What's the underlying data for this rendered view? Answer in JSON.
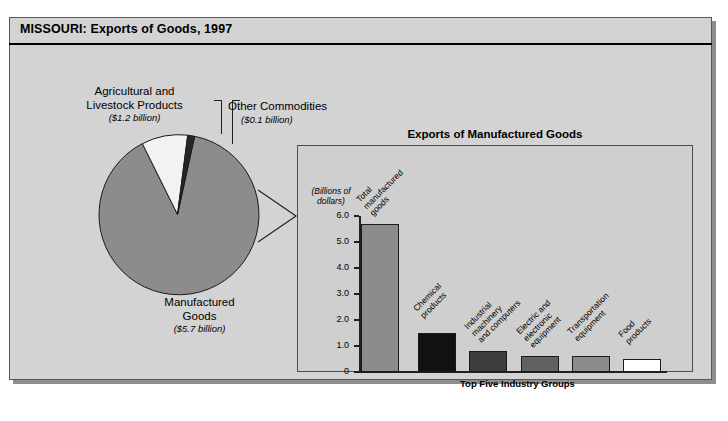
{
  "header": {
    "title": "MISSOURI: Exports of Goods, 1997"
  },
  "pie": {
    "labels": {
      "agricultural": {
        "name": "Agricultural and Livestock Products",
        "line1": "Agricultural and",
        "line2": "Livestock Products",
        "value": "($1.2 billion)"
      },
      "other": {
        "name": "Other Commodities",
        "line1": "Other Commodities",
        "value": "($0.1 billion)"
      },
      "manufactured": {
        "name": "Manufactured Goods",
        "line1": "Manufactured",
        "line2": "Goods",
        "value": "($5.7 billion)"
      }
    }
  },
  "panel": {
    "title": "Exports of Manufactured Goods",
    "units_line1": "(Billions of",
    "units_line2": "dollars)",
    "bracket_label": "Top Five Industry Groups"
  },
  "colors": {
    "page_background": "#ffffff",
    "card_background": "#d3d3d3",
    "panel_background": "#cfcfcf",
    "pie_manufactured": "#8c8c8c",
    "pie_agricultural": "#f2f2f2",
    "pie_other": "#262626",
    "bar_total": "#8c8c8c",
    "bar_chemical": "#111111",
    "bar_industrial": "#3d3d3d",
    "bar_electric": "#616161",
    "bar_transportation": "#8c8c8c",
    "bar_food": "#ffffff",
    "axis": "#231f20"
  },
  "chart_data": [
    {
      "type": "pie",
      "title": "MISSOURI: Exports of Goods, 1997",
      "categories": [
        "Manufactured Goods",
        "Agricultural and Livestock Products",
        "Other Commodities"
      ],
      "values": [
        5.7,
        1.2,
        0.1
      ],
      "units": "billions of dollars",
      "labels": [
        "($5.7 billion)",
        "($1.2 billion)",
        "($0.1 billion)"
      ],
      "legend": "none"
    },
    {
      "type": "bar",
      "title": "Exports of Manufactured Goods",
      "xlabel": "",
      "ylabel": "(Billions of dollars)",
      "ylim": [
        0,
        6.0
      ],
      "yticks": [
        "0",
        "1.0",
        "2.0",
        "3.0",
        "4.0",
        "5.0",
        "6.0"
      ],
      "grid": false,
      "legend": "none",
      "annotation": "Top Five Industry Groups",
      "categories": [
        "Total manufactured goods",
        "Chemical products",
        "Industrial machinery and computers",
        "Electric and electronic equipment",
        "Transportation equipment",
        "Food products"
      ],
      "category_lines": [
        [
          "Total",
          "manufactured",
          "goods"
        ],
        [
          "Chemical",
          "products"
        ],
        [
          "Industrial",
          "machinery",
          "and computers"
        ],
        [
          "Electric and",
          "electronic",
          "equipment"
        ],
        [
          "Transportation",
          "equipment"
        ],
        [
          "Food",
          "products"
        ]
      ],
      "values": [
        5.7,
        1.5,
        0.8,
        0.6,
        0.6,
        0.5
      ],
      "bar_colors": [
        "#8c8c8c",
        "#111111",
        "#3d3d3d",
        "#616161",
        "#8c8c8c",
        "#ffffff"
      ]
    }
  ]
}
